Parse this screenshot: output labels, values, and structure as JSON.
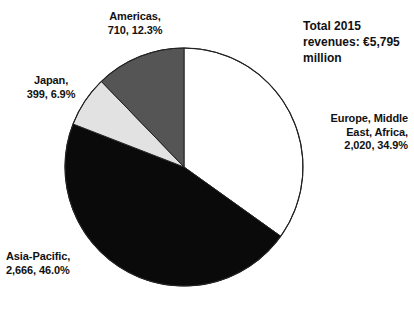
{
  "title": {
    "line1": "Total 2015",
    "line2": "revenues:",
    "line3": "€5,795 million",
    "full": "Total 2015 revenues: €5,795 million"
  },
  "labels": {
    "americas": "Americas,\n710, 12.3%",
    "japan": "Japan,\n399, 6.9%",
    "emea": "Europe, Middle\nEast, Africa,\n2,020, 34.9%",
    "asiapacific": "Asia-Pacific,\n2,666, 46.0%"
  },
  "colors": {
    "emea": "#ffffff",
    "asiapacific": "#0a0a0a",
    "japan": "#e2e2e2",
    "americas": "#555555",
    "outline": "#222222",
    "text": "#111111",
    "background": "#ffffff"
  },
  "chart_data": {
    "type": "pie",
    "title": "Total 2015 revenues: €5,795 million",
    "unit": "€ million",
    "total": 5795,
    "total_label": "€5,795 million",
    "start_angle_deg": 0,
    "direction": "clockwise",
    "center": {
      "x": 184,
      "y": 167
    },
    "radius": 119,
    "legend": "none",
    "labels_position": "outside",
    "categories": [
      "Europe, Middle East, Africa",
      "Asia-Pacific",
      "Japan",
      "Americas"
    ],
    "values": [
      2020,
      2666,
      399,
      710
    ],
    "value_labels": [
      "2,020",
      "2,666",
      "399",
      "710"
    ],
    "percentages": [
      34.9,
      46.0,
      6.9,
      12.3
    ],
    "percentage_labels": [
      "34.9%",
      "6.9%",
      "46.0%",
      "12.3%"
    ],
    "slice_colors": [
      "#ffffff",
      "#0a0a0a",
      "#e2e2e2",
      "#555555"
    ],
    "slices": [
      {
        "name": "Europe, Middle East, Africa",
        "value": 2020,
        "value_label": "2,020",
        "percent": 34.9,
        "percent_label": "34.9%",
        "color": "#ffffff",
        "start_deg": 0.0,
        "end_deg": 125.6
      },
      {
        "name": "Asia-Pacific",
        "value": 2666,
        "value_label": "2,666",
        "percent": 46.0,
        "percent_label": "46.0%",
        "color": "#0a0a0a",
        "start_deg": 125.6,
        "end_deg": 291.2
      },
      {
        "name": "Japan",
        "value": 399,
        "value_label": "399",
        "percent": 6.9,
        "percent_label": "6.9%",
        "color": "#e2e2e2",
        "start_deg": 291.2,
        "end_deg": 316.0
      },
      {
        "name": "Americas",
        "value": 710,
        "value_label": "710",
        "percent": 12.3,
        "percent_label": "12.3%",
        "color": "#555555",
        "start_deg": 316.0,
        "end_deg": 360.0
      }
    ]
  }
}
